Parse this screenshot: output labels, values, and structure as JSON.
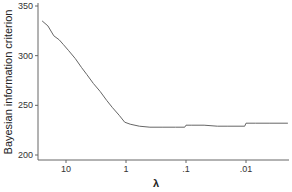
{
  "chart_data": {
    "type": "line",
    "title": "",
    "xlabel": "λ",
    "ylabel": "Bayesian information criterion",
    "x_scale": "log (reversed)",
    "x_ticks": [
      10,
      1,
      0.1,
      0.01
    ],
    "x_tick_labels": [
      "10",
      "1",
      ".1",
      ".01"
    ],
    "y_ticks": [
      200,
      250,
      300,
      350
    ],
    "y_tick_labels": [
      "200",
      "250",
      "300",
      "350"
    ],
    "ylim": [
      195,
      352
    ],
    "xlim": [
      27,
      0.0015
    ],
    "grid": false,
    "legend": null,
    "series": [
      {
        "name": "BIC",
        "color": "#666666",
        "x": [
          25,
          20,
          16,
          13,
          11,
          9,
          7,
          5.5,
          4.5,
          3.5,
          2.7,
          2.1,
          1.7,
          1.3,
          1.05,
          0.85,
          0.6,
          0.4,
          0.25,
          0.15,
          0.105,
          0.1,
          0.08,
          0.05,
          0.03,
          0.02,
          0.0105,
          0.01,
          0.007,
          0.004,
          0.002
        ],
        "values": [
          335,
          330,
          320,
          316,
          311,
          305,
          297,
          288,
          281,
          272,
          264,
          255,
          248,
          240,
          233,
          231,
          229,
          228,
          228,
          228,
          228,
          230,
          230,
          230,
          229,
          229,
          229,
          232,
          232,
          232,
          232
        ]
      }
    ]
  }
}
